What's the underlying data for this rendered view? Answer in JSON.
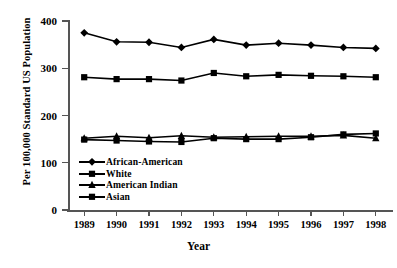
{
  "chart_data": {
    "type": "line",
    "title": "",
    "xlabel": "Year",
    "ylabel": "Per 100,000 Standard US Population",
    "categories": [
      "1989",
      "1990",
      "1991",
      "1992",
      "1993",
      "1994",
      "1995",
      "1996",
      "1997",
      "1998"
    ],
    "x": [
      1989,
      1990,
      1991,
      1992,
      1993,
      1994,
      1995,
      1996,
      1997,
      1998
    ],
    "ylim": [
      0,
      400
    ],
    "yticks": [
      0,
      100,
      200,
      300,
      400
    ],
    "ytick_labels": [
      "0",
      "100",
      "200",
      "300",
      "400"
    ],
    "grid": false,
    "legend_position": "inside-lower-left",
    "series": [
      {
        "name": "African-American",
        "marker": "diamond",
        "color": "#000000",
        "values": [
          375,
          356,
          355,
          344,
          361,
          349,
          353,
          349,
          344,
          342
        ]
      },
      {
        "name": "White",
        "marker": "square",
        "color": "#000000",
        "values": [
          281,
          277,
          277,
          274,
          290,
          283,
          286,
          284,
          283,
          281
        ]
      },
      {
        "name": "American Indian",
        "marker": "triangle",
        "color": "#000000",
        "values": [
          152,
          156,
          153,
          157,
          154,
          155,
          156,
          156,
          158,
          152
        ]
      },
      {
        "name": "Asian",
        "marker": "square",
        "color": "#000000",
        "values": [
          149,
          147,
          145,
          144,
          152,
          150,
          150,
          154,
          160,
          162
        ]
      }
    ]
  }
}
